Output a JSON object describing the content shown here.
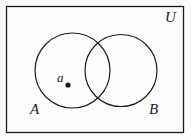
{
  "figure": {
    "kind": "venn-diagram",
    "width": 191,
    "height": 140,
    "background_color": "#fdfdfd",
    "stroke_color": "#1a1a1a",
    "label_color": "#1a1a1a"
  },
  "universe": {
    "label": "U",
    "rect": {
      "x": 6,
      "y": 6,
      "width": 178,
      "height": 127
    },
    "label_position": {
      "x": 165,
      "y": 10
    }
  },
  "sets": [
    {
      "name": "set-a",
      "label": "A",
      "center": {
        "x": 72.5,
        "y": 70.5
      },
      "radius": 37.5,
      "label_position": {
        "x": 30,
        "y": 102
      }
    },
    {
      "name": "set-b",
      "label": "B",
      "center": {
        "x": 121,
        "y": 70.5
      },
      "radius": 36,
      "label_position": {
        "x": 149,
        "y": 102
      }
    }
  ],
  "elements": [
    {
      "name": "element-a",
      "label": "a",
      "member_of": "set-a",
      "point": {
        "x": 68,
        "y": 85,
        "radius": 2.6
      },
      "label_position": {
        "x": 57,
        "y": 71
      }
    }
  ]
}
